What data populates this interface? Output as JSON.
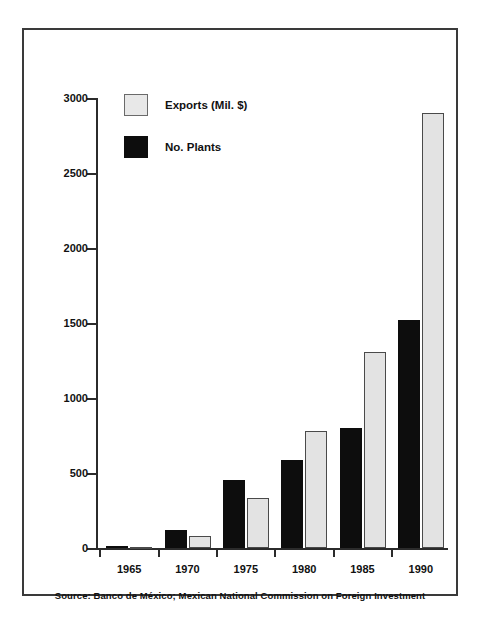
{
  "chart_data": {
    "type": "bar",
    "title": "",
    "xlabel": "",
    "ylabel": "",
    "categories": [
      "1965",
      "1970",
      "1975",
      "1980",
      "1985",
      "1990"
    ],
    "series": [
      {
        "name": "No. Plants",
        "color": "#0d0d0d",
        "values": [
          12,
          120,
          455,
          590,
          800,
          1520
        ]
      },
      {
        "name": "Exports (Mil. $)",
        "color": "#e3e3e3",
        "values": [
          3,
          80,
          335,
          780,
          1310,
          2900
        ]
      }
    ],
    "ylim": [
      0,
      3000
    ],
    "yticks": [
      0,
      500,
      1000,
      1500,
      2000,
      2500,
      3000
    ],
    "ytick_labels": [
      "0",
      "500",
      "1000",
      "1500",
      "2000",
      "2500",
      "3000"
    ],
    "grid": false,
    "legend_position": "upper-left",
    "legend_order": [
      "Exports (Mil. $)",
      "No. Plants"
    ]
  },
  "legend": {
    "items": [
      {
        "label": "Exports (Mil. $)",
        "swatch": "exports"
      },
      {
        "label": "No. Plants",
        "swatch": "plants"
      }
    ]
  },
  "source": {
    "text": "Source: Banco de México; Mexican National Commission on Foreign Investment"
  },
  "colors": {
    "plants": "#0d0d0d",
    "exports": "#e3e3e3",
    "axis": "#2b2b2b",
    "frame": "#3a3a3a",
    "text": "#111111",
    "background": "#ffffff"
  }
}
